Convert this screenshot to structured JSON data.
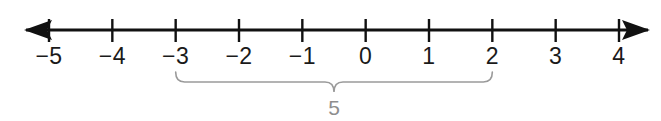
{
  "figure": {
    "kind": "number-line",
    "background_color": "#ffffff",
    "axis_color": "#111111",
    "label_color": "#1a1a1a",
    "brace_color": "#9a9a9a"
  },
  "chart_data": {
    "type": "number-line",
    "title": "",
    "xlabel": "",
    "ylabel": "",
    "grid": false,
    "legend": null,
    "axis": {
      "min": -5,
      "max": 4,
      "step": 1,
      "arrow_left": true,
      "arrow_right": true,
      "pixel_min_x": 49,
      "pixel_max_x": 619,
      "pixel_y": 30
    },
    "tick_values": [
      -5,
      -4,
      -3,
      -2,
      -1,
      0,
      1,
      2,
      3,
      4
    ],
    "tick_labels": [
      "−5",
      "−4",
      "−3",
      "−2",
      "−1",
      "0",
      "1",
      "2",
      "3",
      "4"
    ],
    "annotations": [
      {
        "kind": "brace",
        "from": -3,
        "to": 2,
        "label": "5",
        "position": "below",
        "meaning": "distance from -3 to 2 is 5 units"
      }
    ]
  }
}
